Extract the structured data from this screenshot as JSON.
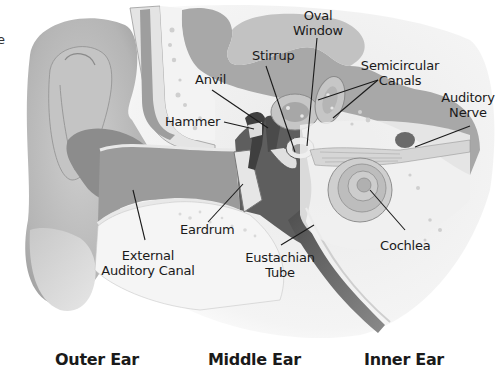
{
  "diagram": {
    "partial_edge_text": "e",
    "labels": {
      "oval_window": [
        "Oval",
        "Window"
      ],
      "stirrup": "Stirrup",
      "semicircular_canals": [
        "Semicircular",
        "Canals"
      ],
      "anvil": "Anvil",
      "auditory_nerve": [
        "Auditory",
        "Nerve"
      ],
      "hammer": "Hammer",
      "eardrum": "Eardrum",
      "external_auditory_canal": [
        "External",
        "Auditory Canal"
      ],
      "eustachian_tube": [
        "Eustachian",
        "Tube"
      ],
      "cochlea": "Cochlea"
    },
    "sections": [
      {
        "label": "Outer Ear"
      },
      {
        "label": "Middle Ear"
      },
      {
        "label": "Inner Ear"
      }
    ],
    "colors": {
      "background": "#ffffff",
      "skin_light": "#d9d9d9",
      "skin_mid": "#bdbdbd",
      "skin_dark": "#8f8f8f",
      "bone": "#efefef",
      "cavity_dark": "#5a5a5a",
      "brain_gray": "#a6a6a6",
      "text": "#1a1a1a"
    }
  }
}
